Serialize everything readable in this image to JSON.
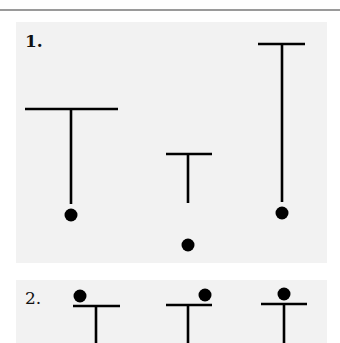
{
  "colors": {
    "page_background": "#ffffff",
    "panel_background": "#f2f2f2",
    "rule": "#9a9a9a",
    "ink": "#000000"
  },
  "panels": [
    {
      "label": "1.",
      "figures": [
        {
          "bar_x1": 25,
          "bar_x2": 118,
          "bar_y": 109,
          "stem_x": 71,
          "stem_y2": 204,
          "dot_cx": 71,
          "dot_cy": 215,
          "dot_r": 6.5
        },
        {
          "bar_x1": 166,
          "bar_x2": 212,
          "bar_y": 154,
          "stem_x": 188,
          "stem_y2": 203,
          "dot_cx": 188,
          "dot_cy": 245,
          "dot_r": 6.5
        },
        {
          "bar_x1": 258,
          "bar_x2": 305,
          "bar_y": 44,
          "stem_x": 282,
          "stem_y2": 202,
          "dot_cx": 282,
          "dot_cy": 213,
          "dot_r": 6.5
        }
      ]
    },
    {
      "label": "2.",
      "figures": [
        {
          "bar_x1": 73,
          "bar_x2": 120,
          "bar_y": 306,
          "stem_x": 96,
          "stem_y2": 343,
          "dot_cx": 80,
          "dot_cy": 296,
          "dot_r": 6.5
        },
        {
          "bar_x1": 166,
          "bar_x2": 212,
          "bar_y": 305,
          "stem_x": 188,
          "stem_y2": 343,
          "dot_cx": 205,
          "dot_cy": 295,
          "dot_r": 6.5
        },
        {
          "bar_x1": 261,
          "bar_x2": 307,
          "bar_y": 304,
          "stem_x": 284,
          "stem_y2": 343,
          "dot_cx": 284,
          "dot_cy": 294,
          "dot_r": 6.5
        }
      ]
    }
  ]
}
